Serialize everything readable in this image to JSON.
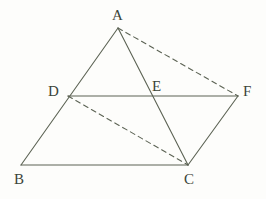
{
  "figure": {
    "background_color": "#fdfdfb",
    "stroke_color": "#5c6354",
    "label_color": "#3c4438",
    "width": 266,
    "height": 199
  },
  "points": {
    "A": {
      "label": "A",
      "x": 118,
      "y": 28,
      "label_x": 112,
      "label_y": 8
    },
    "B": {
      "label": "B",
      "x": 21,
      "y": 165,
      "label_x": 14,
      "label_y": 172
    },
    "C": {
      "label": "C",
      "x": 188,
      "y": 165,
      "label_x": 184,
      "label_y": 172
    },
    "D": {
      "label": "D",
      "x": 68,
      "y": 96,
      "label_x": 48,
      "label_y": 84
    },
    "E": {
      "label": "E",
      "x": 155,
      "y": 96,
      "label_x": 152,
      "label_y": 79
    },
    "F": {
      "label": "F",
      "x": 238,
      "y": 96,
      "label_x": 243,
      "label_y": 84
    }
  },
  "segments": [
    {
      "name": "segment-AB",
      "from": "A",
      "to": "B",
      "style": "solid"
    },
    {
      "name": "segment-AC",
      "from": "A",
      "to": "C",
      "style": "solid"
    },
    {
      "name": "segment-BC",
      "from": "B",
      "to": "C",
      "style": "solid"
    },
    {
      "name": "segment-DF",
      "from": "D",
      "to": "F",
      "style": "solid"
    },
    {
      "name": "segment-CF",
      "from": "C",
      "to": "F",
      "style": "solid"
    },
    {
      "name": "segment-AF",
      "from": "A",
      "to": "F",
      "style": "dashed"
    },
    {
      "name": "segment-DC",
      "from": "D",
      "to": "C",
      "style": "dashed"
    }
  ],
  "stroke": {
    "width": 1.1,
    "dash_pattern": "5,4"
  }
}
